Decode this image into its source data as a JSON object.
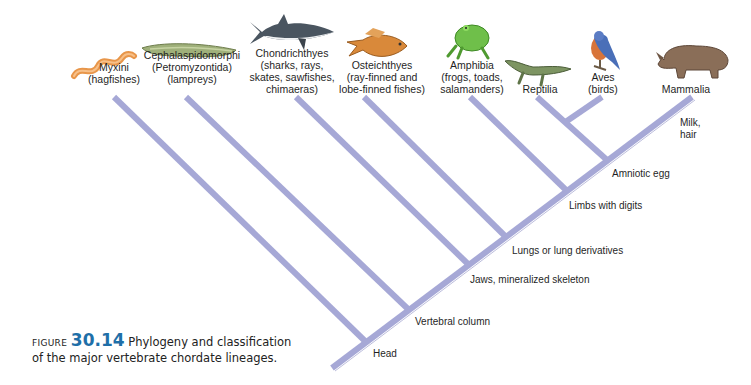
{
  "colors": {
    "branch": "#a6a8d6",
    "branch_edge": "#8f91c4",
    "figure_number": "#1f6fa8"
  },
  "taxa": [
    {
      "name": "Myxini",
      "common": "(hagfishes)",
      "icon": "hagfish-illustration"
    },
    {
      "name": "Cephalaspidomorphi",
      "sub": "(Petromyzontida)",
      "common": "(lampreys)",
      "icon": "lamprey-illustration"
    },
    {
      "name": "Chondrichthyes",
      "common1": "(sharks, rays,",
      "common2": "skates, sawfishes,",
      "common3": "chimaeras)",
      "icon": "shark-illustration"
    },
    {
      "name": "Osteichthyes",
      "common1": "(ray-finned and",
      "common2": "lobe-finned fishes)",
      "icon": "bony-fish-illustration"
    },
    {
      "name": "Amphibia",
      "common1": "(frogs, toads,",
      "common2": "salamanders)",
      "icon": "frog-illustration"
    },
    {
      "name": "Reptilia",
      "icon": "crocodile-illustration"
    },
    {
      "name": "Aves",
      "common": "(birds)",
      "icon": "bird-illustration"
    },
    {
      "name": "Mammalia",
      "icon": "rhinoceros-illustration"
    }
  ],
  "traits": [
    {
      "label": "Head"
    },
    {
      "label": "Vertebral column"
    },
    {
      "label": "Jaws, mineralized skeleton"
    },
    {
      "label": "Lungs or lung derivatives"
    },
    {
      "label": "Limbs with digits"
    },
    {
      "label": "Amniotic egg"
    },
    {
      "label": "Milk,",
      "label2": "hair"
    }
  ],
  "caption": {
    "figure_word": "Figure",
    "figure_number": "30.14",
    "line1": "Phylogeny and classification",
    "line2": "of the major vertebrate chordate lineages."
  }
}
